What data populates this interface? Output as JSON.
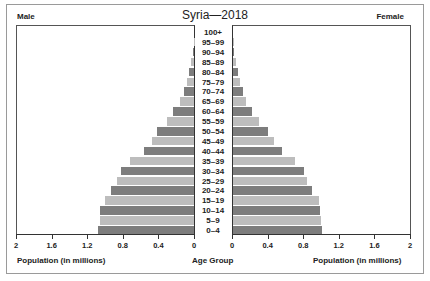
{
  "chart_data": {
    "type": "bar",
    "subtype": "population-pyramid",
    "title": "Syria—2018",
    "left_label": "Male",
    "right_label": "Female",
    "xlabel_left": "Population (in millions)",
    "xlabel_center": "Age Group",
    "xlabel_right": "Population (in millions)",
    "xlim": [
      0,
      2
    ],
    "left_ticks": [
      "2",
      "1.6",
      "1.2",
      "0.8",
      "0.4",
      "0"
    ],
    "right_ticks": [
      "0",
      "0.4",
      "0.8",
      "1.2",
      "1.6",
      "2"
    ],
    "grid": false,
    "categories": [
      "100+",
      "95–99",
      "90–94",
      "85–89",
      "80–84",
      "75–79",
      "70–74",
      "65–69",
      "60–64",
      "55–59",
      "50–54",
      "45–49",
      "40–44",
      "35–39",
      "30–34",
      "25–29",
      "20–24",
      "15–19",
      "10–14",
      "5–9",
      "0–4"
    ],
    "series": [
      {
        "name": "Male",
        "values": [
          0.0,
          0.005,
          0.01,
          0.03,
          0.06,
          0.08,
          0.11,
          0.16,
          0.24,
          0.31,
          0.42,
          0.48,
          0.56,
          0.72,
          0.82,
          0.87,
          0.94,
          1.01,
          1.06,
          1.06,
          1.08
        ]
      },
      {
        "name": "Female",
        "values": [
          0.0,
          0.005,
          0.01,
          0.03,
          0.06,
          0.08,
          0.11,
          0.15,
          0.21,
          0.29,
          0.39,
          0.46,
          0.55,
          0.7,
          0.8,
          0.84,
          0.89,
          0.97,
          0.98,
          0.99,
          1.01
        ]
      }
    ],
    "colors": {
      "dark": "#7d7d7d",
      "light": "#bdbdbd"
    }
  }
}
